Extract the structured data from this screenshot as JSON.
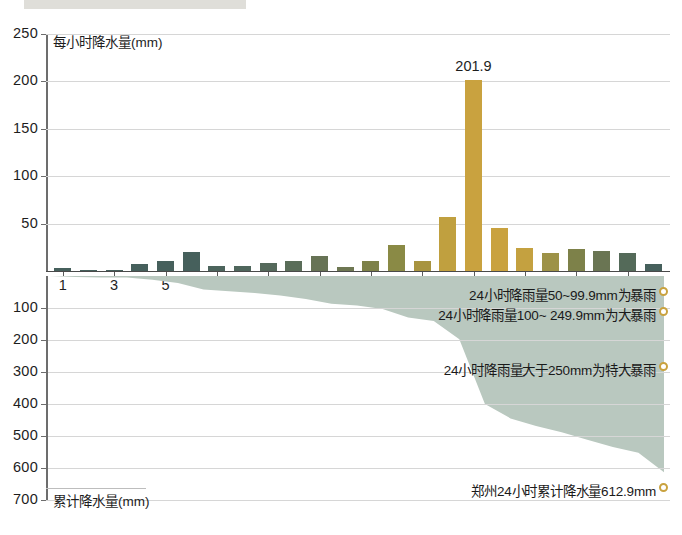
{
  "header": {
    "strip_color": "#d9d8d2"
  },
  "colors": {
    "bar_green": "#46605c",
    "bar_gold": "#c9a23f",
    "area_fill": "#b9c8bf",
    "grid": "#d6d6d6",
    "axis": "#6d6d6d",
    "marker": "#c9a23f"
  },
  "chart_data": [
    {
      "type": "bar",
      "id": "hourly-precipitation",
      "title": "",
      "xlabel": "时",
      "ylabel": "每小时降水量(mm)",
      "ylim": [
        0,
        250
      ],
      "yticks": [
        0,
        50,
        100,
        150,
        200,
        250
      ],
      "ytick_labels": [
        "",
        "50",
        "100",
        "150",
        "200",
        "250"
      ],
      "grid": true,
      "categories": [
        1,
        2,
        3,
        4,
        5,
        6,
        7,
        8,
        9,
        10,
        11,
        12,
        13,
        14,
        15,
        16,
        17,
        18,
        19,
        20,
        21,
        22,
        23,
        24
      ],
      "xtick_labels": [
        "1",
        "3",
        "5",
        "7",
        "9",
        "11",
        "13",
        "15",
        "17",
        "19",
        "21",
        "23"
      ],
      "xtick_values": [
        1,
        3,
        5,
        7,
        9,
        11,
        13,
        15,
        17,
        19,
        21,
        23
      ],
      "values": [
        3.0,
        1.5,
        0.3,
        7.0,
        10.5,
        20.0,
        5.5,
        5.0,
        8.5,
        10.5,
        15.5,
        4.5,
        11.0,
        27.0,
        11.0,
        57.0,
        201.9,
        45.0,
        24.0,
        19.0,
        23.5,
        21.5,
        18.5,
        7.5
      ],
      "bar_colors": [
        "#46605c",
        "#46605c",
        "#46605c",
        "#46605c",
        "#46605c",
        "#46605c",
        "#4c645c",
        "#4f665c",
        "#55695b",
        "#5a6d59",
        "#677355",
        "#6e7752",
        "#7d8149",
        "#8a8a45",
        "#a89440",
        "#c0a03f",
        "#c9a23f",
        "#c9a23f",
        "#c4a140",
        "#9d9247",
        "#7d8149",
        "#6a7553",
        "#546a59",
        "#46605c"
      ],
      "annotated_point": {
        "x": 17,
        "value": 201.9,
        "label": "201.9"
      }
    },
    {
      "type": "area",
      "id": "cumulative-precipitation",
      "title": "",
      "xlabel": "",
      "ylabel": "累计降水量(mm)",
      "ylim": [
        0,
        700
      ],
      "y_inverted": true,
      "yticks": [
        100,
        200,
        300,
        400,
        500,
        600,
        700
      ],
      "ytick_labels": [
        "100",
        "200",
        "300",
        "400",
        "500",
        "600",
        "700"
      ],
      "grid": true,
      "x": [
        0,
        1,
        2,
        3,
        4,
        5,
        6,
        7,
        8,
        9,
        10,
        11,
        12,
        13,
        14,
        15,
        16,
        17,
        18,
        19,
        20,
        21,
        22,
        23,
        24
      ],
      "values": [
        0,
        3,
        4.5,
        5,
        12,
        22,
        42,
        48,
        53,
        61,
        72,
        87,
        92,
        103,
        130,
        141,
        198,
        400,
        445,
        469,
        488,
        512,
        534,
        552,
        612.9
      ],
      "final_value": 612.9,
      "annotations": [
        {
          "id": "heavy-rain",
          "text": "24小时降雨量50~99.9mm为暴雨",
          "threshold": 50
        },
        {
          "id": "very-heavy-rain",
          "text": "24小时降雨量100~ 249.9mm为大暴雨",
          "threshold": 100
        },
        {
          "id": "extreme-rain",
          "text": "24小时降雨量大于250mm为特大暴雨",
          "threshold": 250
        },
        {
          "id": "zhengzhou-total",
          "text": "郑州24小时累计降水量612.9mm",
          "threshold": 612.9
        }
      ]
    }
  ]
}
